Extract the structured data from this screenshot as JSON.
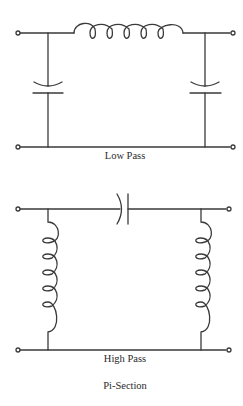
{
  "diagram": {
    "title": "Pi-Section",
    "stroke_color": "#3a3a3a",
    "circuits": [
      {
        "name": "Low Pass",
        "label": "Low Pass",
        "series_element": "inductor",
        "shunt_elements": [
          "capacitor",
          "capacitor"
        ],
        "inductor_turns": 5
      },
      {
        "name": "High Pass",
        "label": "High Pass",
        "series_element": "capacitor",
        "shunt_elements": [
          "inductor",
          "inductor"
        ],
        "inductor_turns": 5
      }
    ]
  }
}
